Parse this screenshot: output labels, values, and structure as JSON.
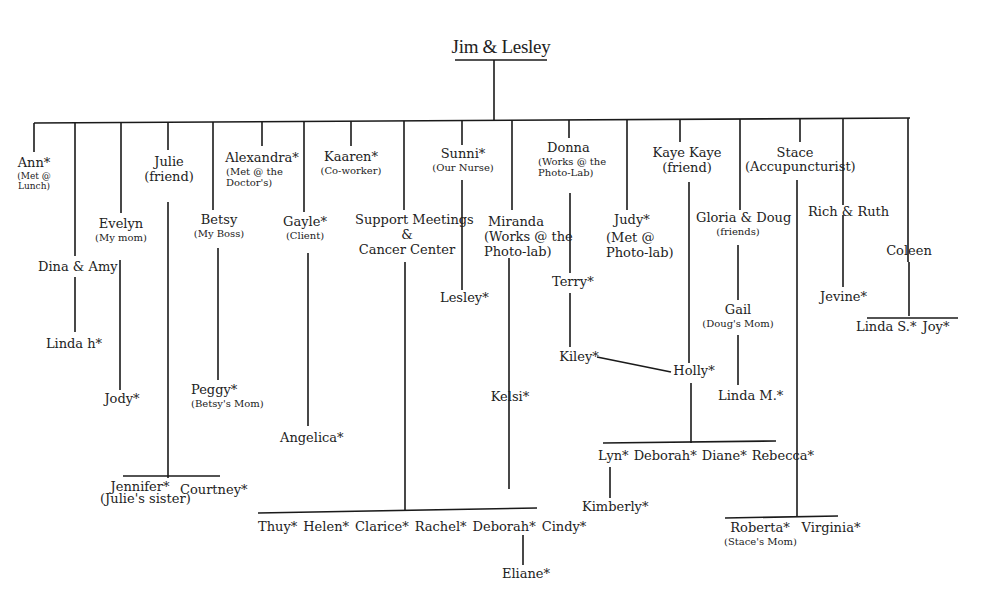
{
  "diagram": {
    "title": "Jim & Lesley",
    "nodes": {
      "ann": {
        "name": "Ann*",
        "note": "(Met @",
        "note2": "Lunch)"
      },
      "dina_amy": {
        "name": "Dina & Amy"
      },
      "linda_h": {
        "name": "Linda h*"
      },
      "evelyn": {
        "name": "Evelyn",
        "note": "(My mom)"
      },
      "jody": {
        "name": "Jody*"
      },
      "julie": {
        "name": "Julie",
        "note": "(friend)"
      },
      "jennifer": {
        "name": "Jennifer*",
        "note": "(Julie's sister)"
      },
      "courtney": {
        "name": "Courtney*"
      },
      "betsy": {
        "name": "Betsy",
        "note": "(My Boss)"
      },
      "peggy": {
        "name": "Peggy*",
        "note": "(Betsy's Mom)"
      },
      "alexandra": {
        "name": "Alexandra*",
        "note": "(Met @ the",
        "note2": "Doctor's)"
      },
      "gayle": {
        "name": "Gayle*",
        "note": "(Client)"
      },
      "angelica": {
        "name": "Angelica*"
      },
      "kaaren": {
        "name": "Kaaren*",
        "note": "(Co-worker)"
      },
      "support": {
        "name": "Support Meetings",
        "name2": "&",
        "name3": "Cancer Center"
      },
      "support_children": [
        "Thuy*",
        "Helen*",
        "Clarice*",
        "Rachel*",
        "Deborah*",
        "Cindy*"
      ],
      "eliane": {
        "name": "Eliane*"
      },
      "sunni": {
        "name": "Sunni*",
        "note": "(Our Nurse)"
      },
      "lesley": {
        "name": "Lesley*"
      },
      "miranda": {
        "name": "Miranda",
        "note": "(Works @ the",
        "note2": "Photo-lab)"
      },
      "kelsi": {
        "name": "Kelsi*"
      },
      "donna": {
        "name": "Donna",
        "note": "(Works @ the",
        "note2": "Photo-Lab)"
      },
      "terry": {
        "name": "Terry*"
      },
      "kiley": {
        "name": "Kiley*"
      },
      "judy": {
        "name": "Judy*",
        "note": "(Met @",
        "note2": "Photo-lab)"
      },
      "kaye_kaye": {
        "name": "Kaye Kaye",
        "note": "(friend)"
      },
      "holly": {
        "name": "Holly*"
      },
      "holly_children": [
        "Lyn*",
        "Deborah*",
        "Diane*",
        "Rebecca*"
      ],
      "kimberly": {
        "name": "Kimberly*"
      },
      "gloria_doug": {
        "name": "Gloria & Doug",
        "note": "(friends)"
      },
      "gail": {
        "name": "Gail",
        "note": "(Doug's Mom)"
      },
      "linda_m": {
        "name": "Linda M.*"
      },
      "stace": {
        "name": "Stace",
        "note": "(Accupuncturist)"
      },
      "roberta": {
        "name": "Roberta*",
        "note": "(Stace's Mom)"
      },
      "virginia": {
        "name": "Virginia*"
      },
      "rich_ruth": {
        "name": "Rich & Ruth"
      },
      "jevine": {
        "name": "Jevine*"
      },
      "coleen": {
        "name": "Coleen"
      },
      "linda_s": {
        "name": "Linda S.*"
      },
      "joy": {
        "name": "Joy*"
      }
    },
    "colors": {
      "line": "#1a1a1a",
      "text": "#222222",
      "background": "#ffffff"
    }
  }
}
